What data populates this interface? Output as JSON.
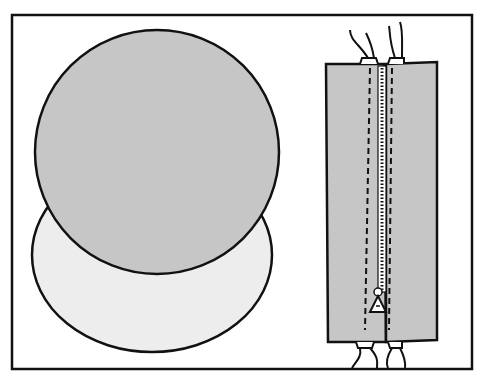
{
  "illustration": {
    "subject": "sewing diagram: two fabric circles and a zipper sewn between fabric panels",
    "colors": {
      "background": "#ffffff",
      "outline": "#111111",
      "fabric_dark": "#c6c6c6",
      "fabric_light": "#ededed"
    }
  }
}
